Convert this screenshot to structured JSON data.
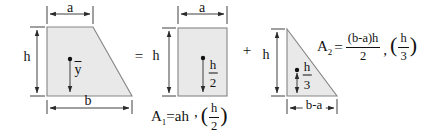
{
  "diagram": {
    "trapezoid": {
      "dim_top": "a",
      "dim_left": "h",
      "dim_bottom": "b",
      "centroid_label": "y"
    },
    "operators": {
      "equals": "=",
      "plus": "+"
    },
    "rectangle": {
      "dim_top": "a",
      "dim_left": "h",
      "centroid_frac": {
        "num": "h",
        "den": "2"
      }
    },
    "triangle": {
      "dim_left": "h",
      "dim_bottom": "b-a",
      "centroid_frac": {
        "num": "h",
        "den": "3"
      }
    }
  },
  "formula_a1": {
    "symbol": "A",
    "subscript": "1",
    "equals_expr": "=ah",
    "separator": ",",
    "paren_open": "(",
    "frac_num": "h",
    "frac_den": "2",
    "paren_close": ")"
  },
  "formula_a2": {
    "symbol": "A",
    "subscript": "2",
    "equals": "=",
    "frac1_num": "(b-a)h",
    "frac1_den": "2",
    "separator": ",",
    "paren_open": "(",
    "frac2_num": "h",
    "frac2_den": "3",
    "paren_close": ")"
  },
  "colors": {
    "shape_fill": "#e9e9e9",
    "shape_stroke": "#858585",
    "line": "#2a2a2a",
    "text": "#121212",
    "background": "#ffffff"
  }
}
